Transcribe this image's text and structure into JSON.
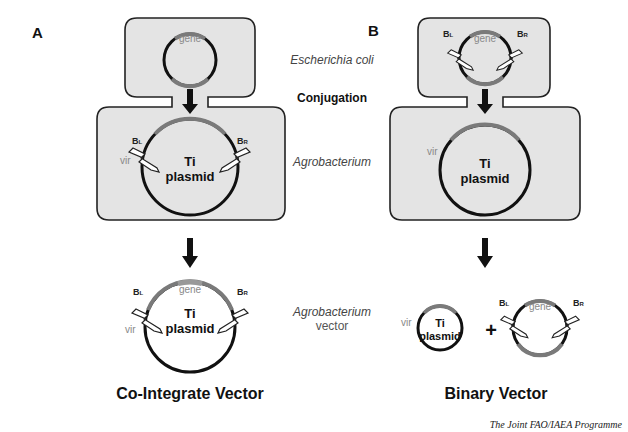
{
  "panels": {
    "a_label": "A",
    "b_label": "B"
  },
  "middle_labels": {
    "ecoli": "Escherichia coli",
    "conjugation": "Conjugation",
    "agrobacterium": "Agrobacterium",
    "vector_line1": "Agrobacterium",
    "vector_line2": "vector"
  },
  "plasmid": {
    "gene": "gene",
    "ti_line1": "Ti",
    "ti_line2": "plasmid",
    "vir": "vir",
    "bl": "BL",
    "br": "BR",
    "bl_main": "B",
    "bl_sub": "L",
    "br_main": "B",
    "br_sub": "R",
    "plus": "+"
  },
  "titles": {
    "cointegrate": "Co-Integrate Vector",
    "binary": "Binary Vector"
  },
  "credit": "The Joint FAO/IAEA Programme",
  "colors": {
    "cell_fill": "#e4e4e4",
    "dna": "#111111",
    "t_dna_segment": "#7a7a7a"
  }
}
